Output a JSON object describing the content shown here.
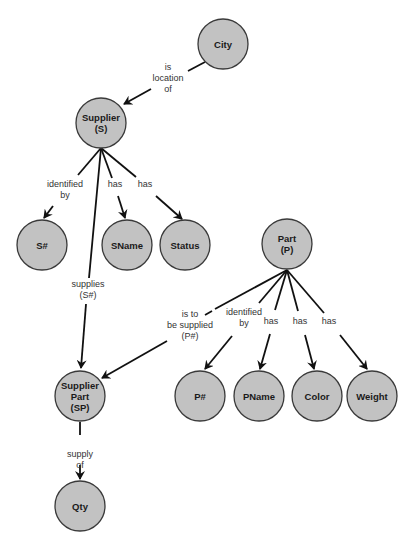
{
  "diagram": {
    "type": "semantic-network",
    "colors": {
      "node_fill": "#c2c2c2",
      "node_stroke": "#3a3a3a",
      "edge": "#111111",
      "label": "#333333"
    },
    "node_radius": 25,
    "nodes": [
      {
        "id": "city",
        "lines": [
          "City"
        ],
        "x": 223,
        "y": 44
      },
      {
        "id": "supplier",
        "lines": [
          "Supplier",
          "(S)"
        ],
        "x": 101,
        "y": 123
      },
      {
        "id": "s-num",
        "lines": [
          "S#"
        ],
        "x": 42,
        "y": 245
      },
      {
        "id": "sname",
        "lines": [
          "SName"
        ],
        "x": 127,
        "y": 245
      },
      {
        "id": "status",
        "lines": [
          "Status"
        ],
        "x": 185,
        "y": 245
      },
      {
        "id": "part",
        "lines": [
          "Part",
          "(P)"
        ],
        "x": 287,
        "y": 244
      },
      {
        "id": "supplier-part",
        "lines": [
          "Supplier",
          "Part",
          "(SP)"
        ],
        "x": 80,
        "y": 396
      },
      {
        "id": "p-num",
        "lines": [
          "P#"
        ],
        "x": 200,
        "y": 396
      },
      {
        "id": "pname",
        "lines": [
          "PName"
        ],
        "x": 259,
        "y": 396
      },
      {
        "id": "color",
        "lines": [
          "Color"
        ],
        "x": 317,
        "y": 396
      },
      {
        "id": "weight",
        "lines": [
          "Weight"
        ],
        "x": 372,
        "y": 396
      },
      {
        "id": "qty",
        "lines": [
          "Qty"
        ],
        "x": 80,
        "y": 506
      }
    ],
    "edges": [
      {
        "from": "city",
        "to": "supplier",
        "label": [
          "is",
          "location",
          "of"
        ],
        "label_x": 168,
        "label_y": 70,
        "segments": [
          [
            205,
            62,
            188,
            71
          ],
          [
            151,
            89,
            124,
            104
          ]
        ]
      },
      {
        "from": "supplier",
        "to": "s-num",
        "label": [
          "identified",
          "by"
        ],
        "label_x": 65,
        "label_y": 187,
        "segments": [
          [
            101,
            148,
            78,
            175
          ],
          [
            53,
            206,
            44,
            218
          ]
        ]
      },
      {
        "from": "supplier",
        "to": "sname",
        "label": [
          "has"
        ],
        "label_x": 115,
        "label_y": 187,
        "segments": [
          [
            101,
            148,
            112,
            178
          ],
          [
            118,
            196,
            125,
            218
          ]
        ]
      },
      {
        "from": "supplier",
        "to": "status",
        "label": [
          "has"
        ],
        "label_x": 145,
        "label_y": 187,
        "segments": [
          [
            101,
            148,
            136,
            177
          ],
          [
            156,
            196,
            182,
            219
          ]
        ]
      },
      {
        "from": "supplier",
        "to": "supplier-part",
        "label": [
          "supplies",
          "(S#)"
        ],
        "label_x": 88,
        "label_y": 287,
        "segments": [
          [
            101,
            148,
            89,
            278
          ],
          [
            86,
            304,
            81,
            368
          ]
        ]
      },
      {
        "from": "part",
        "to": "supplier-part",
        "label": [
          "is to",
          "be supplied",
          "(P#)"
        ],
        "label_x": 190,
        "label_y": 317,
        "segments": [
          [
            287,
            270,
            215,
            309
          ],
          [
            212,
            311,
            205,
            315
          ],
          [
            167,
            341,
            102,
            378
          ]
        ]
      },
      {
        "from": "part",
        "to": "p-num",
        "label": [
          "identified",
          "by"
        ],
        "label_x": 244,
        "label_y": 315,
        "segments": [
          [
            287,
            270,
            259,
            303
          ],
          [
            232,
            336,
            205,
            369
          ]
        ]
      },
      {
        "from": "part",
        "to": "pname",
        "label": [
          "has"
        ],
        "label_x": 271,
        "label_y": 324,
        "segments": [
          [
            287,
            270,
            275,
            310
          ],
          [
            270,
            334,
            260,
            369
          ]
        ]
      },
      {
        "from": "part",
        "to": "color",
        "label": [
          "has"
        ],
        "label_x": 300,
        "label_y": 324,
        "segments": [
          [
            287,
            270,
            298,
            311
          ],
          [
            305,
            335,
            314,
            369
          ]
        ]
      },
      {
        "from": "part",
        "to": "weight",
        "label": [
          "has"
        ],
        "label_x": 329,
        "label_y": 324,
        "segments": [
          [
            287,
            270,
            324,
            313
          ],
          [
            340,
            335,
            367,
            369
          ]
        ]
      },
      {
        "from": "supplier-part",
        "to": "qty",
        "label": [
          "supply",
          "of"
        ],
        "label_x": 80,
        "label_y": 457,
        "segments": [
          [
            80,
            422,
            80,
            435
          ],
          [
            80,
            465,
            80,
            479
          ]
        ]
      }
    ]
  }
}
